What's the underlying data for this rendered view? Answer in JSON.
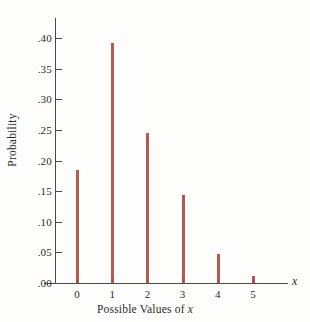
{
  "chart_data": {
    "type": "bar",
    "title": "",
    "subtitle": "",
    "xlabel": "Possible Values of x",
    "ylabel": "Probability",
    "axis_variable": "x",
    "categories": [
      "0",
      "1",
      "2",
      "3",
      "4",
      "5"
    ],
    "values": [
      0.185,
      0.392,
      0.245,
      0.143,
      0.048,
      0.012
    ],
    "series": [
      {
        "name": "Probability",
        "values": [
          0.185,
          0.392,
          0.245,
          0.143,
          0.048,
          0.012
        ]
      }
    ],
    "ylim": [
      0.0,
      0.425
    ],
    "xlim": [
      -0.95,
      6.0
    ],
    "ytick_values": [
      0.0,
      0.05,
      0.1,
      0.15,
      0.2,
      0.25,
      0.3,
      0.35,
      0.4
    ],
    "ytick_labels": [
      ".00",
      ".05",
      ".10",
      ".15",
      ".20",
      ".25",
      ".30",
      ".35",
      ".40"
    ],
    "xtick_labels": [
      "0",
      "1",
      "2",
      "3",
      "4",
      "5"
    ],
    "grid": false,
    "legend": false,
    "legend_position": "none",
    "bar_color": "#b35a52",
    "tick_color": "#b0453c",
    "axis_color": "#4a4a4a",
    "background_color": "#fdfdfc"
  }
}
